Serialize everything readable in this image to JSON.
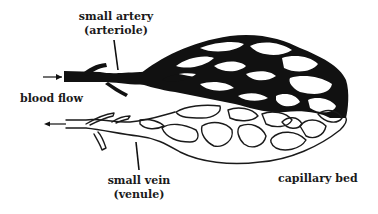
{
  "diagram": {
    "type": "capillary-bed-illustration",
    "colors": {
      "artery_fill": "#111111",
      "vein_stroke": "#1a1a1a",
      "background": "#ffffff",
      "text": "#1a1a1a"
    },
    "labels": {
      "artery_line1": "small artery",
      "artery_line2": "(arteriole)",
      "blood_flow": "blood flow",
      "vein_line1": "small vein",
      "vein_line2": "(venule)",
      "capillary_bed": "capillary bed"
    },
    "icons": {
      "inflow_arrow": "arrow-right-icon",
      "outflow_arrow": "arrow-left-icon"
    }
  }
}
